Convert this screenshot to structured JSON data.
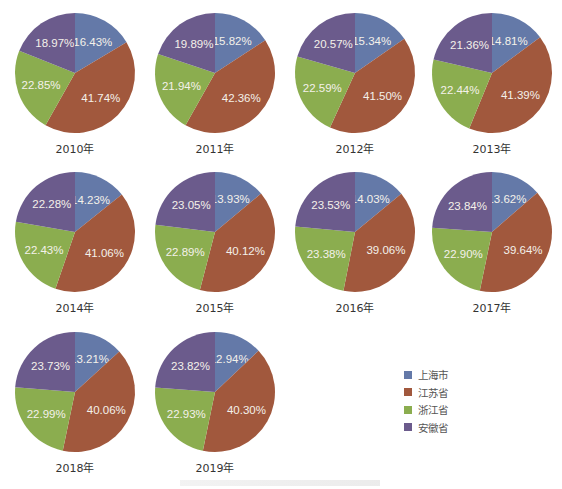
{
  "legend": {
    "items": [
      {
        "label": "上海市",
        "color": "#6479a8"
      },
      {
        "label": "江苏省",
        "color": "#a1583d"
      },
      {
        "label": "浙江省",
        "color": "#8bad4f"
      },
      {
        "label": "安徽省",
        "color": "#6b5b8c"
      }
    ]
  },
  "chart_data": {
    "type": "pie",
    "series_names": [
      "上海市",
      "江苏省",
      "浙江省",
      "安徽省"
    ],
    "colors": [
      "#6479a8",
      "#a1583d",
      "#8bad4f",
      "#6b5b8c"
    ],
    "legend_position": "right-bottom",
    "charts": [
      {
        "title": "2010年",
        "values": [
          16.43,
          41.74,
          22.85,
          18.97
        ]
      },
      {
        "title": "2011年",
        "values": [
          15.82,
          42.36,
          21.94,
          19.89
        ]
      },
      {
        "title": "2012年",
        "values": [
          15.34,
          41.5,
          22.59,
          20.57
        ]
      },
      {
        "title": "2013年",
        "values": [
          14.81,
          41.39,
          22.44,
          21.36
        ]
      },
      {
        "title": "2014年",
        "values": [
          14.23,
          41.06,
          22.43,
          22.28
        ]
      },
      {
        "title": "2015年",
        "values": [
          13.93,
          40.12,
          22.89,
          23.05
        ]
      },
      {
        "title": "2016年",
        "values": [
          14.03,
          39.06,
          23.38,
          23.53
        ]
      },
      {
        "title": "2017年",
        "values": [
          13.62,
          39.64,
          22.9,
          23.84
        ]
      },
      {
        "title": "2018年",
        "values": [
          13.21,
          40.06,
          22.99,
          23.73
        ]
      },
      {
        "title": "2019年",
        "values": [
          12.94,
          40.3,
          22.93,
          23.82
        ]
      }
    ]
  }
}
